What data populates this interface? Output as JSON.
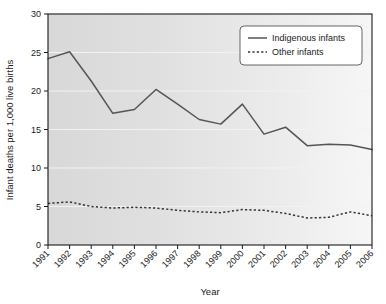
{
  "chart_data": {
    "type": "line",
    "title": "",
    "xlabel": "Year",
    "ylabel": "Infant deaths per 1,000 live births",
    "categories": [
      "1991",
      "1992",
      "1993",
      "1994",
      "1995",
      "1996",
      "1997",
      "1998",
      "1999",
      "2000",
      "2001",
      "2002",
      "2003",
      "2004",
      "2005",
      "2006"
    ],
    "xlim": [
      1991,
      2006
    ],
    "ylim": [
      0,
      30
    ],
    "yticks": [
      0,
      5,
      10,
      15,
      20,
      25,
      30
    ],
    "ytick_labels": [
      "0",
      "5",
      "10",
      "15",
      "20",
      "25",
      "30"
    ],
    "grid": true,
    "legend_position": "top-right",
    "series": [
      {
        "name": "Indigenous infants",
        "style": "solid",
        "color": "#555555",
        "values": [
          24.2,
          25.1,
          21.3,
          17.1,
          17.6,
          20.2,
          18.3,
          16.3,
          15.7,
          18.3,
          14.4,
          15.3,
          12.9,
          13.1,
          13.0,
          12.4
        ]
      },
      {
        "name": "Other infants",
        "style": "dashed",
        "color": "#333333",
        "values": [
          5.4,
          5.6,
          5.0,
          4.8,
          4.9,
          4.8,
          4.5,
          4.3,
          4.2,
          4.6,
          4.5,
          4.1,
          3.5,
          3.6,
          4.3,
          3.8
        ]
      }
    ]
  },
  "legend": {
    "entries": [
      {
        "label": "Indigenous infants",
        "style": "solid"
      },
      {
        "label": "Other infants",
        "style": "dashed"
      }
    ]
  },
  "axes": {
    "x_title": "Year",
    "y_title": "Infant deaths per 1,000 live births"
  }
}
